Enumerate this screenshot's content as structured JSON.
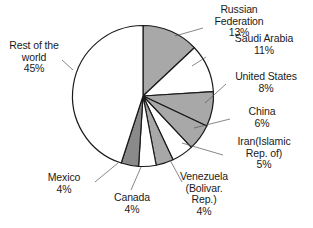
{
  "chart_data": {
    "type": "pie",
    "title": "",
    "subtitle": "",
    "xlabel": "",
    "ylabel": "",
    "legend_position": "none",
    "labels_show_percent": true,
    "start_angle_deg": 0,
    "direction": "clockwise",
    "categories": [
      "Russian Federation",
      "Saudi Arabia",
      "United States",
      "China",
      "Iran(Islamic Rep. of)",
      "Venezuela (Bolivar. Rep.)",
      "Canada",
      "Mexico",
      "Rest of the world"
    ],
    "values": [
      13,
      11,
      8,
      6,
      5,
      4,
      4,
      4,
      45
    ],
    "units": "%",
    "slices": [
      {
        "name": "Russian Federation",
        "value": 13,
        "value_text": "13%",
        "fill": "#a8a8a8",
        "stroke": "#1a1a1a",
        "label_lines": [
          "Russian",
          "Federation",
          "13%"
        ]
      },
      {
        "name": "Saudi Arabia",
        "value": 11,
        "value_text": "11%",
        "fill": "#ffffff",
        "stroke": "#1a1a1a",
        "label_lines": [
          "Saudi Arabia",
          "11%"
        ]
      },
      {
        "name": "United States",
        "value": 8,
        "value_text": "8%",
        "fill": "#a8a8a8",
        "stroke": "#1a1a1a",
        "label_lines": [
          "United States",
          "8%"
        ]
      },
      {
        "name": "China",
        "value": 6,
        "value_text": "6%",
        "fill": "#a8a8a8",
        "stroke": "#1a1a1a",
        "label_lines": [
          "China",
          "6%"
        ]
      },
      {
        "name": "Iran(Islamic Rep. of)",
        "value": 5,
        "value_text": "5%",
        "fill": "#ffffff",
        "stroke": "#1a1a1a",
        "label_lines": [
          "Iran(Islamic",
          "Rep. of)",
          "5%"
        ]
      },
      {
        "name": "Venezuela (Bolivar. Rep.)",
        "value": 4,
        "value_text": "4%",
        "fill": "#a8a8a8",
        "stroke": "#1a1a1a",
        "label_lines": [
          "Venezuela",
          "(Bolivar.",
          "Rep.)",
          "4%"
        ]
      },
      {
        "name": "Canada",
        "value": 4,
        "value_text": "4%",
        "fill": "#ffffff",
        "stroke": "#1a1a1a",
        "label_lines": [
          "Canada",
          "4%"
        ]
      },
      {
        "name": "Mexico",
        "value": 4,
        "value_text": "4%",
        "fill": "#8a8a8a",
        "stroke": "#1a1a1a",
        "label_lines": [
          "Mexico",
          "4%"
        ]
      },
      {
        "name": "Rest of the world",
        "value": 45,
        "value_text": "45%",
        "fill": "#ffffff",
        "stroke": "#1a1a1a",
        "label_lines": [
          "Rest of the",
          "world",
          "45%"
        ]
      }
    ]
  },
  "labels": {
    "russian_federation": {
      "l1": "Russian",
      "l2": "Federation",
      "l3": "13%"
    },
    "saudi_arabia": {
      "l1": "Saudi Arabia",
      "l2": "11%"
    },
    "united_states": {
      "l1": "United States",
      "l2": "8%"
    },
    "china": {
      "l1": "China",
      "l2": "6%"
    },
    "iran": {
      "l1": "Iran(Islamic",
      "l2": "Rep. of)",
      "l3": "5%"
    },
    "venezuela": {
      "l1": "Venezuela",
      "l2": "(Bolivar.",
      "l3": "Rep.)",
      "l4": "4%"
    },
    "canada": {
      "l1": "Canada",
      "l2": "4%"
    },
    "mexico": {
      "l1": "Mexico",
      "l2": "4%"
    },
    "rest_of_world": {
      "l1": "Rest of the",
      "l2": "world",
      "l3": "45%"
    }
  }
}
